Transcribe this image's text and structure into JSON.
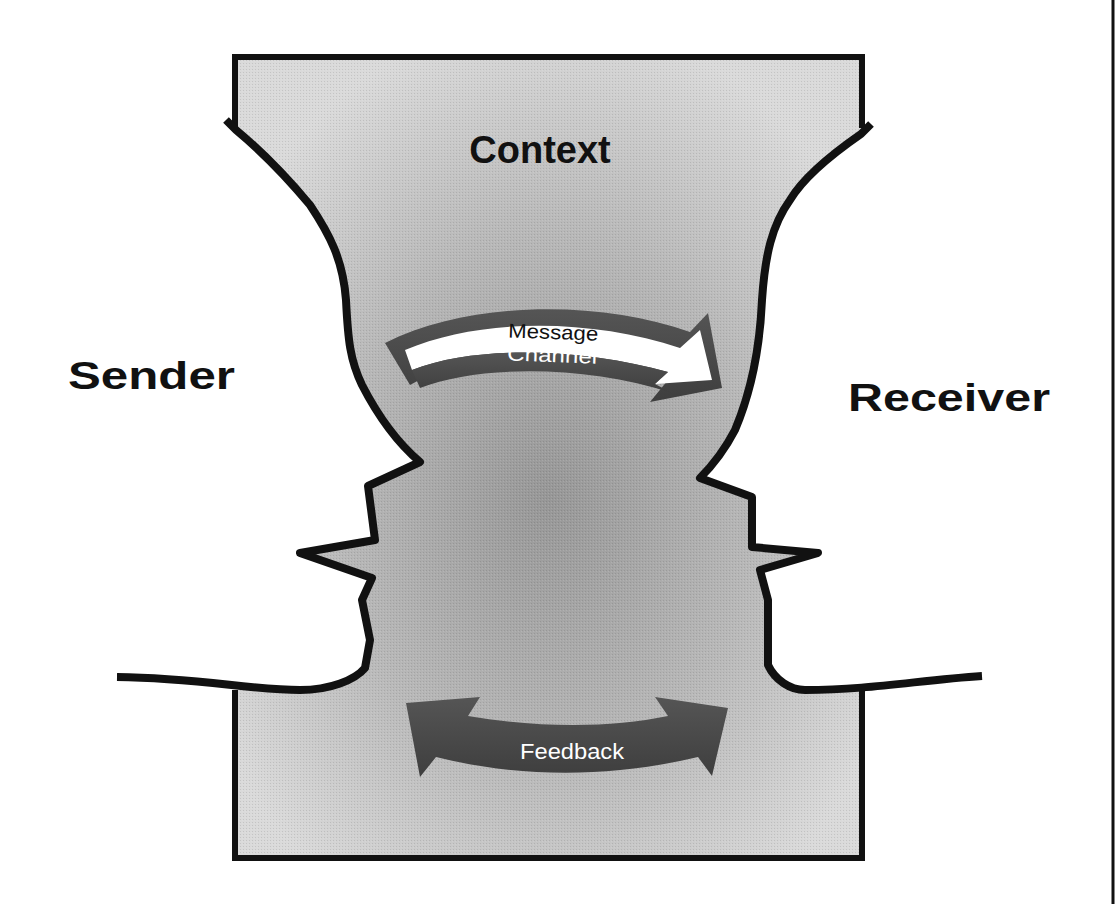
{
  "diagram": {
    "labels": {
      "context": "Context",
      "sender": "Sender",
      "receiver": "Receiver",
      "message": "Message",
      "channel": "Channel",
      "feedback": "Feedback"
    },
    "colors": {
      "outline": "#111111",
      "background": "#ffffff",
      "context_light": "#d6d6d6",
      "context_dark": "#9a9a9a",
      "arrow_dark": "#4a4a4a",
      "arrow_light": "#ffffff"
    }
  }
}
